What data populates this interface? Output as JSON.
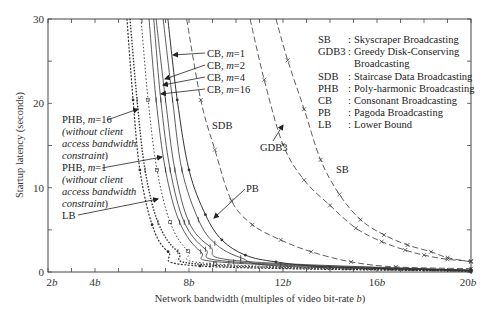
{
  "chart_data": {
    "type": "line",
    "title": "",
    "xlabel": "Network bandwidth (multiples of video bit-rate b)",
    "ylabel": "Startup latency (seconds)",
    "xlim": [
      2,
      20
    ],
    "ylim": [
      0,
      30
    ],
    "x_tick_labels": [
      "2b",
      "4b",
      "8b",
      "12b",
      "16b",
      "20b"
    ],
    "x_tick_values": [
      2,
      4,
      8,
      12,
      16,
      20
    ],
    "y_tick_labels": [
      "0",
      "10",
      "20",
      "30"
    ],
    "y_tick_values": [
      0,
      10,
      20,
      30
    ],
    "grid": false,
    "legend_position": "upper right (text box)",
    "legend": [
      {
        "abbr": "SB",
        "name": "Skyscraper Broadcasting"
      },
      {
        "abbr": "GDB3",
        "name": "Greedy Disk-Conserving Broadcasting"
      },
      {
        "abbr": "SDB",
        "name": "Staircase Data Broadcasting"
      },
      {
        "abbr": "PHB",
        "name": "Poly-harmonic Broadcasting"
      },
      {
        "abbr": "CB",
        "name": "Consonant Broadcasting"
      },
      {
        "abbr": "PB",
        "name": "Pagoda Broadcasting"
      },
      {
        "abbr": "LB",
        "name": "Lower Bound"
      }
    ],
    "series": [
      {
        "name": "SB",
        "style": "dashed",
        "x": [
          11.7,
          12.2,
          12.9,
          13.6,
          14.4,
          15.3,
          16.3,
          17.3,
          18.3,
          19.0,
          20.0
        ],
        "y": [
          30,
          25.1,
          19.3,
          13.3,
          9.2,
          6.2,
          4.4,
          3.2,
          2.4,
          1.7,
          1.2
        ]
      },
      {
        "name": "GDB3",
        "style": "dashed",
        "x": [
          10.6,
          11.2,
          12.0,
          12.9,
          14.0,
          15.1,
          16.2,
          17.2,
          18.0,
          19.0,
          20.0
        ],
        "y": [
          30,
          22.8,
          15.1,
          10.9,
          7.9,
          5.2,
          3.6,
          2.6,
          2.0,
          1.5,
          1.3
        ]
      },
      {
        "name": "SDB",
        "style": "dashed",
        "x": [
          7.9,
          8.5,
          9.1,
          9.8,
          10.7,
          11.9,
          13.2,
          14.9,
          16.8,
          20.0
        ],
        "y": [
          30,
          20.4,
          14.5,
          8.5,
          5.6,
          3.8,
          2.4,
          1.2,
          0.6,
          0.4
        ]
      },
      {
        "name": "PB",
        "style": "solid-marker",
        "x": [
          7.1,
          7.5,
          8.0,
          8.7,
          9.4,
          10.4,
          11.7,
          14.0,
          20.0
        ],
        "y": [
          30,
          20.4,
          12.1,
          6.8,
          3.8,
          2.0,
          1.2,
          0.6,
          0.2
        ]
      },
      {
        "name": "CB, m=1",
        "style": "solid",
        "x": [
          6.9,
          7.3,
          7.7,
          8.4,
          9.1,
          10.2,
          11.9,
          20.0
        ],
        "y": [
          30,
          20.4,
          12.1,
          6.2,
          3.4,
          1.7,
          0.7,
          0.2
        ]
      },
      {
        "name": "CB, m=2",
        "style": "solid",
        "x": [
          6.6,
          7.0,
          7.4,
          8.0,
          8.9,
          10.2,
          20.0
        ],
        "y": [
          30,
          20.4,
          12.1,
          5.9,
          3.0,
          1.3,
          0.2
        ]
      },
      {
        "name": "CB, m=4",
        "style": "solid",
        "x": [
          6.5,
          6.8,
          7.2,
          7.8,
          8.7,
          9.9,
          20.0
        ],
        "y": [
          30,
          20.4,
          12.1,
          5.9,
          2.7,
          1.2,
          0.2
        ]
      },
      {
        "name": "CB, m=16",
        "style": "solid",
        "x": [
          6.3,
          6.6,
          7.0,
          7.6,
          8.5,
          9.7,
          20.0
        ],
        "y": [
          30,
          20.4,
          12.1,
          5.9,
          2.4,
          1.1,
          0.1
        ]
      },
      {
        "name": "PHB, m=1 (without client access bandwidth constraint)",
        "style": "dotted",
        "x": [
          5.96,
          6.26,
          6.64,
          7.2,
          7.96,
          9.1,
          20.0
        ],
        "y": [
          30,
          20.4,
          12.1,
          5.9,
          2.5,
          0.95,
          0.1
        ]
      },
      {
        "name": "PHB, m=16 (without client access bandwidth constraint)",
        "style": "dotted-heavy",
        "x": [
          5.49,
          5.79,
          6.13,
          6.68,
          7.53,
          8.89,
          20.0
        ],
        "y": [
          30,
          20.4,
          12.1,
          5.9,
          2.4,
          0.83,
          0.1
        ]
      },
      {
        "name": "LB",
        "style": "dotted-marker",
        "x": [
          5.36,
          5.62,
          5.91,
          6.43,
          7.11,
          8.47,
          20.0
        ],
        "y": [
          30,
          20.4,
          12.1,
          5.6,
          2.4,
          0.71,
          0.1
        ]
      }
    ],
    "annotations": [
      {
        "text": "CB, m=1",
        "target": "CB, m=1"
      },
      {
        "text": "CB, m=2",
        "target": "CB, m=2"
      },
      {
        "text": "CB, m=4",
        "target": "CB, m=4"
      },
      {
        "text": "CB, m=16",
        "target": "CB, m=16"
      },
      {
        "text": "PHB, m=16 (without client access bandwidth constraint)",
        "target": "PHB, m=16"
      },
      {
        "text": "PHB, m=1 (without client access bandwidth constraint)",
        "target": "PHB, m=1"
      },
      {
        "text": "LB",
        "target": "LB"
      },
      {
        "text": "SDB",
        "target": "SDB"
      },
      {
        "text": "GDB3",
        "target": "GDB3"
      },
      {
        "text": "SB",
        "target": "SB"
      },
      {
        "text": "PB",
        "target": "PB"
      }
    ]
  },
  "labels": {
    "ylabel": "Startup latency (seconds)",
    "xlabel": "Network bandwidth (multiples of video bit-rate b)",
    "xlabel_main": "Network bandwidth (multiples of video bit-rate ",
    "xlabel_var": "b",
    "xlabel_end": ")",
    "x_ticks": [
      {
        "num": "2",
        "var": "b"
      },
      {
        "num": "4",
        "var": "b"
      },
      {
        "num": "8",
        "var": "b"
      },
      {
        "num": "12",
        "var": "b"
      },
      {
        "num": "16",
        "var": "b"
      },
      {
        "num": "20",
        "var": "b"
      }
    ],
    "y_ticks": [
      "0",
      "10",
      "20",
      "30"
    ],
    "cb": [
      {
        "prefix": "CB, ",
        "var": "m",
        "suffix": "=1"
      },
      {
        "prefix": "CB, ",
        "var": "m",
        "suffix": "=2"
      },
      {
        "prefix": "CB, ",
        "var": "m",
        "suffix": "=4"
      },
      {
        "prefix": "CB, ",
        "var": "m",
        "suffix": "=16"
      }
    ],
    "phb16": {
      "prefix": "PHB, ",
      "var": "m",
      "suffix": "=16",
      "l2": "(without client",
      "l3": "access bandwidth",
      "l4": "constraint",
      "l4end": ")"
    },
    "phb1": {
      "prefix": "PHB, ",
      "var": "m",
      "suffix": "=1",
      "l2": "(without client",
      "l3": "access bandwidth",
      "l4": "constraint",
      "l4end": ")"
    },
    "lb": "LB",
    "sdb": "SDB",
    "gdb3": "GDB3",
    "sb": "SB",
    "pb": "PB"
  },
  "legend": {
    "rows": [
      {
        "abbr": "SB",
        "sep": ":",
        "name": "Skyscraper Broadcasting"
      },
      {
        "abbr": "GDB3",
        "sep": ":",
        "name": "Greedy Disk-Conserving"
      },
      {
        "abbr": "",
        "sep": "",
        "name": "Broadcasting"
      },
      {
        "abbr": "SDB",
        "sep": ":",
        "name": "Staircase Data Broadcasting"
      },
      {
        "abbr": "PHB",
        "sep": ":",
        "name": "Poly-harmonic Broadcasting"
      },
      {
        "abbr": "CB",
        "sep": ":",
        "name": "Consonant Broadcasting"
      },
      {
        "abbr": "PB",
        "sep": ":",
        "name": "Pagoda Broadcasting"
      },
      {
        "abbr": "LB",
        "sep": ":",
        "name": "Lower Bound"
      }
    ]
  }
}
